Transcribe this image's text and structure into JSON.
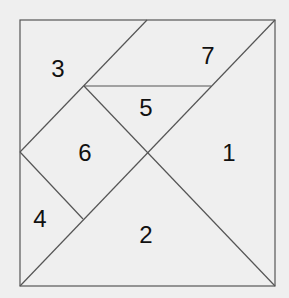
{
  "diagram": {
    "type": "tangram-square",
    "square": {
      "x": 20,
      "y": 20,
      "w": 255,
      "h": 266
    },
    "line_color": "#555555",
    "background": "#efefef",
    "pieces": [
      {
        "label": "1",
        "x": 229,
        "y": 152
      },
      {
        "label": "2",
        "x": 146,
        "y": 234
      },
      {
        "label": "3",
        "x": 58,
        "y": 68
      },
      {
        "label": "4",
        "x": 40,
        "y": 218
      },
      {
        "label": "5",
        "x": 146,
        "y": 107
      },
      {
        "label": "6",
        "x": 85,
        "y": 152
      },
      {
        "label": "7",
        "x": 208,
        "y": 55
      }
    ]
  }
}
